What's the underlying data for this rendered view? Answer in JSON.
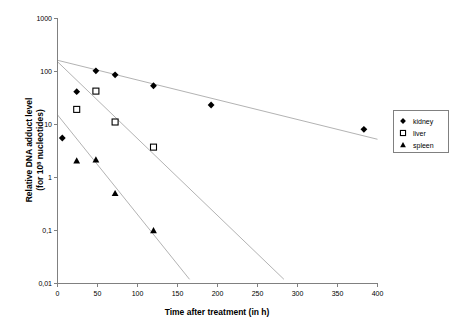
{
  "chart_data": {
    "type": "scatter",
    "title": "",
    "xlabel": "Time after treatment (in h)",
    "ylabel": "Relative DNA adduct level (for 10⁸ nucleotides)",
    "ylabel_line1": "Relative DNA adduct level",
    "ylabel_line2_prefix": "(for 10",
    "ylabel_line2_sup": "8",
    "ylabel_line2_suffix": " nucleotides)",
    "xlim": [
      0,
      400
    ],
    "ylim": [
      0.01,
      1000
    ],
    "yscale": "log",
    "xticks": [
      0,
      50,
      100,
      150,
      200,
      250,
      300,
      350,
      400
    ],
    "xticklabels": [
      "0",
      "50",
      "100",
      "150",
      "200",
      "250",
      "300",
      "350",
      "400"
    ],
    "yticks": [
      0.01,
      0.1,
      1,
      10,
      100,
      1000
    ],
    "yticklabels": [
      "0,01",
      "0,1",
      "1",
      "10",
      "100",
      "1000"
    ],
    "grid": false,
    "legend_position": "right",
    "series": [
      {
        "name": "kidney",
        "marker": "filled-diamond",
        "color": "#000000",
        "points": [
          {
            "x": 6,
            "y": 5.5
          },
          {
            "x": 24,
            "y": 41
          },
          {
            "x": 48,
            "y": 101
          },
          {
            "x": 72,
            "y": 85
          },
          {
            "x": 120,
            "y": 53
          },
          {
            "x": 192,
            "y": 23
          },
          {
            "x": 383,
            "y": 8.0
          }
        ],
        "trend": {
          "x_start": 0,
          "y_start": 160,
          "x_end": 400,
          "y_end": 5.2
        }
      },
      {
        "name": "liver",
        "marker": "open-square",
        "color": "#000000",
        "points": [
          {
            "x": 24,
            "y": 19
          },
          {
            "x": 48,
            "y": 42
          },
          {
            "x": 72,
            "y": 11
          },
          {
            "x": 120,
            "y": 3.7
          }
        ],
        "trend": {
          "x_start": 0,
          "y_start": 150,
          "x_end": 283,
          "y_end": 0.012
        }
      },
      {
        "name": "spleen",
        "marker": "filled-triangle",
        "color": "#000000",
        "points": [
          {
            "x": 24,
            "y": 2.05
          },
          {
            "x": 48,
            "y": 2.15
          },
          {
            "x": 72,
            "y": 0.5
          },
          {
            "x": 120,
            "y": 0.1
          }
        ],
        "trend": {
          "x_start": 0,
          "y_start": 15,
          "x_end": 165,
          "y_end": 0.012
        }
      }
    ]
  },
  "legend": {
    "items": [
      {
        "label": "kidney",
        "marker": "filled-diamond"
      },
      {
        "label": "liver",
        "marker": "open-square"
      },
      {
        "label": "spleen",
        "marker": "filled-triangle"
      }
    ]
  },
  "colors": {
    "axis": "#808080",
    "trend": "#b3b3b3",
    "marker": "#000000",
    "background": "#ffffff"
  }
}
